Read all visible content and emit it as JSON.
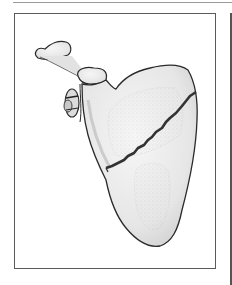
{
  "figure": {
    "colors": {
      "bone_fill": "#eeeeee",
      "bone_shade": "#d8d8d8",
      "outline": "#2a2a2a",
      "fracture_line": "#333333",
      "frame_border": "#5a5a5a",
      "top_rule": "#9a9a9a"
    }
  }
}
